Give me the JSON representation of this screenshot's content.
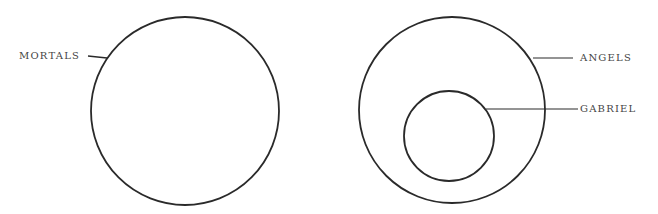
{
  "diagram": {
    "type": "euler-diagram",
    "sets": [
      {
        "label": "MORTALS",
        "contains": []
      },
      {
        "label": "ANGELS",
        "contains": [
          "GABRIEL"
        ]
      },
      {
        "label": "GABRIEL",
        "contains": []
      }
    ],
    "stroke_color": "#2a2a2a",
    "text_color": "#444444"
  }
}
